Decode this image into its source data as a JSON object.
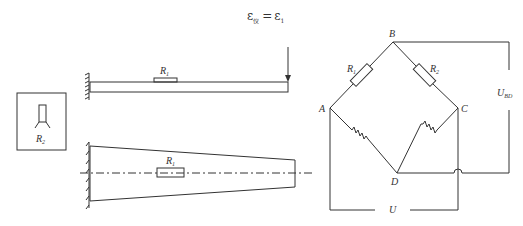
{
  "equation": {
    "text": "ε仪 = ε1",
    "lhs": "ε",
    "lhs_sub": "仪",
    "op": "=",
    "rhs": "ε",
    "rhs_sub": "1"
  },
  "cantilever_side_view": {
    "gauge_label": "R",
    "gauge_sub": "1"
  },
  "compensation_block": {
    "gauge_label": "R",
    "gauge_sub": "2"
  },
  "cantilever_top_view": {
    "gauge_label": "R",
    "gauge_sub": "1"
  },
  "bridge": {
    "nodes": {
      "a": "A",
      "b": "B",
      "c": "C",
      "d": "D"
    },
    "r1_label": "R",
    "r1_sub": "1",
    "r2_label": "R",
    "r2_sub": "2",
    "output_label": "U",
    "output_sub": "BD",
    "supply_label": "U"
  }
}
